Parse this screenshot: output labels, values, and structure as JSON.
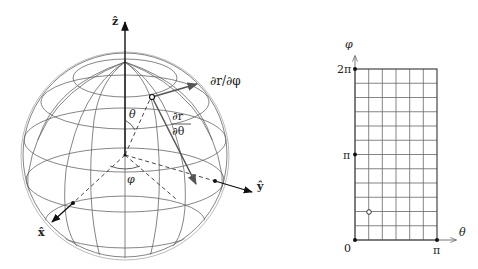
{
  "sphere": {
    "axes": {
      "z_label": "ẑ",
      "x_label": "x̂",
      "y_label": "ŷ"
    },
    "angle_labels": {
      "theta": "θ",
      "phi": "φ"
    },
    "vectors": {
      "dr_dphi": "∂r/∂φ",
      "dr_dtheta_num": "∂r",
      "dr_dtheta_den": "∂θ"
    }
  },
  "grid_plot": {
    "y_axis_label": "φ",
    "x_axis_label": "θ",
    "y_ticks": [
      "2π",
      "π",
      "0"
    ],
    "x_ticks": [
      "π"
    ],
    "columns": 6,
    "rows": 12,
    "highlight_point": {
      "theta_cell": 1,
      "phi_cell": 2.1
    }
  },
  "colors": {
    "line": "#555555",
    "axis": "#111111",
    "grid": "#666666"
  }
}
